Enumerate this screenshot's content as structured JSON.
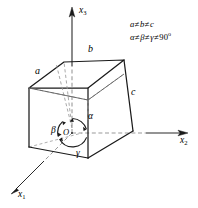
{
  "figure": {
    "name": "triclinic-unit-cell",
    "background_color": "#ffffff",
    "line_color": "#1a1a1a",
    "dashed_color": "#8c8c8c"
  },
  "axes": [
    {
      "id": "x3",
      "label": "x",
      "subscript": "3",
      "direction": "up"
    },
    {
      "id": "x2",
      "label": "x",
      "subscript": "2",
      "direction": "right"
    },
    {
      "id": "x1",
      "label": "x",
      "subscript": "1",
      "direction": "down-left"
    }
  ],
  "edges": [
    {
      "id": "a",
      "label": "a"
    },
    {
      "id": "b",
      "label": "b"
    },
    {
      "id": "c",
      "label": "c"
    }
  ],
  "angles": [
    {
      "id": "alpha",
      "label": "α"
    },
    {
      "id": "beta",
      "label": "β"
    },
    {
      "id": "gamma",
      "label": "γ"
    }
  ],
  "origin": {
    "label": "O"
  },
  "conditions": {
    "line1": {
      "a": "a",
      "ne1": "≠",
      "b": "b",
      "ne2": "≠",
      "c": "c"
    },
    "line2": {
      "alpha": "α",
      "ne1": "≠",
      "beta": "β",
      "ne2": "≠",
      "gamma": "γ",
      "ne3": "≠",
      "value": "90",
      "degree": "o"
    }
  }
}
